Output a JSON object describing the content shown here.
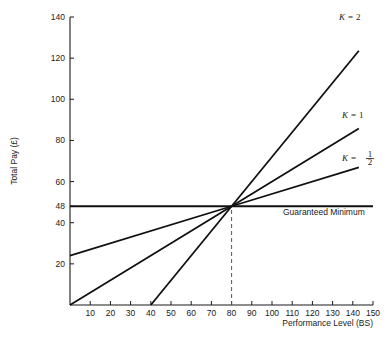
{
  "chart_data": {
    "type": "line",
    "title": "",
    "xlabel": "Performance Level (BS)",
    "ylabel": "Total Pay (£)",
    "xlim": [
      0,
      150
    ],
    "ylim": [
      0,
      140
    ],
    "grid": false,
    "legend_position": "inline-right-of-line-ends",
    "x_ticks": [
      10,
      20,
      30,
      40,
      50,
      60,
      70,
      80,
      90,
      100,
      110,
      120,
      130,
      140,
      150
    ],
    "y_ticks": [
      20,
      40,
      48,
      60,
      80,
      100,
      120,
      140
    ],
    "convergence_point": {
      "x": 80,
      "y": 48
    },
    "series": [
      {
        "name": "K = 2",
        "label_k": "K",
        "label_eq": "=",
        "label_value": "2",
        "k_value": 2,
        "slope": 1.2,
        "x_intercept": 40,
        "points": [
          [
            40,
            0
          ],
          [
            80,
            48
          ],
          [
            143,
            123.6
          ]
        ],
        "end_point": {
          "x": 143,
          "y": 123.6
        }
      },
      {
        "name": "K = 1",
        "label_k": "K",
        "label_eq": "=",
        "label_value": "1",
        "k_value": 1,
        "slope": 0.6,
        "x_intercept": 0,
        "points": [
          [
            0,
            0
          ],
          [
            80,
            48
          ],
          [
            143,
            85.8
          ]
        ],
        "end_point": {
          "x": 143,
          "y": 85.8
        }
      },
      {
        "name": "K = 1/2",
        "label_k": "K",
        "label_eq": "=",
        "label_value_num": "1",
        "label_value_den": "2",
        "k_value": 0.5,
        "slope": 0.3,
        "y_intercept": 24,
        "points": [
          [
            0,
            24
          ],
          [
            80,
            48
          ],
          [
            143,
            66.9
          ]
        ],
        "end_point": {
          "x": 143,
          "y": 66.9
        }
      }
    ],
    "annotations": [
      {
        "name": "guaranteed-minimum",
        "text": "Guaranteed Minimum",
        "type": "horizontal-line",
        "y_value": 48,
        "x_from": 0,
        "x_to": 150
      },
      {
        "name": "convergence-drop-line",
        "type": "vertical-dashed",
        "x_value": 80,
        "y_from": 0,
        "y_to": 48
      }
    ]
  }
}
